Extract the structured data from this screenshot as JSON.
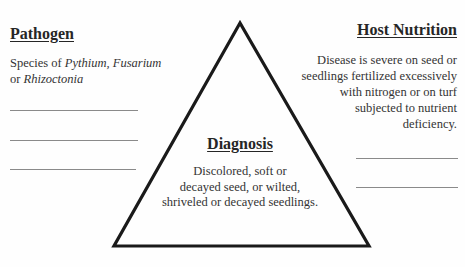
{
  "diagram": {
    "type": "disease-triangle",
    "pathogen": {
      "title": "Pathogen",
      "text_prefix": "Species of ",
      "italic_1": "Pythium, Fusarium",
      "text_mid": "or ",
      "italic_2": "Rhizoctonia",
      "blank_lines": 3
    },
    "host_nutrition": {
      "title": "Host Nutrition",
      "lines": [
        "Disease is severe on seed or",
        "seedlings fertilized excessively",
        "with nitrogen or on turf",
        "subjected to nutrient",
        "deficiency."
      ],
      "blank_lines": 2
    },
    "diagnosis": {
      "title": "Diagnosis",
      "lines": [
        "Discolored, soft or",
        "decayed seed, or wilted,",
        "shriveled or decayed seedlings."
      ]
    },
    "colors": {
      "line": "#1a1a1a",
      "blank": "#8a8a8a"
    }
  }
}
